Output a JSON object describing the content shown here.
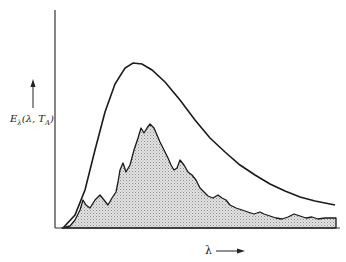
{
  "chart_data": {
    "type": "area",
    "title": "",
    "xlabel": "λ",
    "ylabel": "E_λ(λ, T_A)",
    "ylabel_parts": {
      "main": "E",
      "sub1": "λ",
      "args": "(λ, T",
      "sub2": "A",
      "close": ")"
    },
    "grid": false,
    "ticks": false,
    "series": [
      {
        "name": "blackbody envelope",
        "style": "line",
        "color": "#1a1a1a",
        "points": [
          [
            63,
            228
          ],
          [
            75,
            215
          ],
          [
            85,
            190
          ],
          [
            95,
            150
          ],
          [
            105,
            112
          ],
          [
            115,
            84
          ],
          [
            125,
            68
          ],
          [
            133,
            63
          ],
          [
            142,
            64
          ],
          [
            152,
            70
          ],
          [
            165,
            82
          ],
          [
            180,
            100
          ],
          [
            195,
            120
          ],
          [
            210,
            138
          ],
          [
            225,
            152
          ],
          [
            240,
            165
          ],
          [
            255,
            175
          ],
          [
            270,
            184
          ],
          [
            285,
            191
          ],
          [
            300,
            197
          ],
          [
            315,
            201
          ],
          [
            335,
            205
          ]
        ]
      },
      {
        "name": "measured spectrum",
        "style": "filled-hatched",
        "color": "#1a1a1a",
        "fill": "#cfcfcf",
        "points": [
          [
            62,
            228
          ],
          [
            70,
            226
          ],
          [
            75,
            220
          ],
          [
            80,
            210
          ],
          [
            83,
            200
          ],
          [
            86,
            205
          ],
          [
            90,
            208
          ],
          [
            95,
            200
          ],
          [
            100,
            195
          ],
          [
            104,
            200
          ],
          [
            108,
            205
          ],
          [
            112,
            198
          ],
          [
            116,
            192
          ],
          [
            118,
            182
          ],
          [
            120,
            170
          ],
          [
            123,
            163
          ],
          [
            126,
            172
          ],
          [
            130,
            165
          ],
          [
            134,
            150
          ],
          [
            138,
            138
          ],
          [
            141,
            128
          ],
          [
            144,
            133
          ],
          [
            147,
            128
          ],
          [
            150,
            124
          ],
          [
            154,
            128
          ],
          [
            157,
            135
          ],
          [
            160,
            142
          ],
          [
            164,
            150
          ],
          [
            168,
            158
          ],
          [
            171,
            165
          ],
          [
            174,
            170
          ],
          [
            177,
            168
          ],
          [
            180,
            160
          ],
          [
            184,
            165
          ],
          [
            188,
            172
          ],
          [
            192,
            175
          ],
          [
            196,
            180
          ],
          [
            200,
            188
          ],
          [
            204,
            192
          ],
          [
            208,
            196
          ],
          [
            213,
            198
          ],
          [
            218,
            195
          ],
          [
            222,
            198
          ],
          [
            226,
            200
          ],
          [
            230,
            205
          ],
          [
            236,
            208
          ],
          [
            242,
            210
          ],
          [
            248,
            212
          ],
          [
            254,
            214
          ],
          [
            260,
            212
          ],
          [
            264,
            214
          ],
          [
            270,
            216
          ],
          [
            276,
            218
          ],
          [
            282,
            219
          ],
          [
            288,
            217
          ],
          [
            294,
            214
          ],
          [
            300,
            216
          ],
          [
            306,
            218
          ],
          [
            312,
            217
          ],
          [
            318,
            219
          ],
          [
            325,
            218
          ],
          [
            336,
            218
          ]
        ]
      }
    ],
    "axes": {
      "origin": [
        55,
        228
      ],
      "y_top": 10,
      "x_right": 340
    }
  },
  "labels": {
    "x_axis": "λ",
    "x_arrow": "→"
  }
}
